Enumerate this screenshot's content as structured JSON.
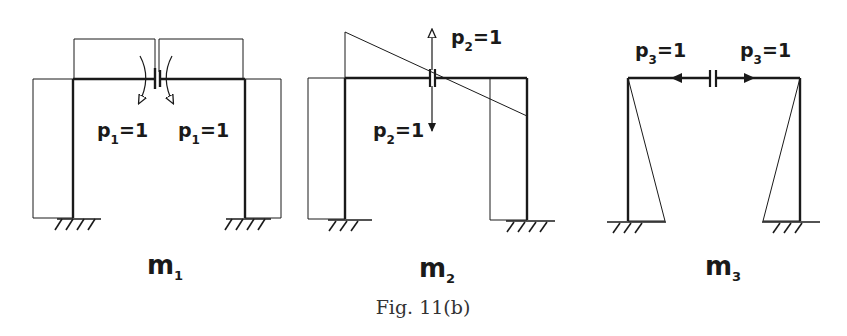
{
  "figure": {
    "caption_prefix": "Fig.",
    "caption_number": "11(b)",
    "caption": "Fig. 11(b)"
  },
  "panels": [
    {
      "id": "m1",
      "label": "m",
      "label_sub": "1",
      "loads": [
        {
          "text": "p",
          "sub": "1",
          "value": "=1",
          "side": "left"
        },
        {
          "text": "p",
          "sub": "1",
          "value": "=1",
          "side": "right"
        }
      ],
      "load_type": "unit moment pair at hinge"
    },
    {
      "id": "m2",
      "label": "m",
      "label_sub": "2",
      "loads": [
        {
          "text": "p",
          "sub": "2",
          "value": "=1",
          "direction": "up"
        },
        {
          "text": "p",
          "sub": "2",
          "value": "=1",
          "direction": "down"
        }
      ],
      "load_type": "unit shear pair at hinge"
    },
    {
      "id": "m3",
      "label": "m",
      "label_sub": "3",
      "loads": [
        {
          "text": "p",
          "sub": "3",
          "value": "=1",
          "direction": "left"
        },
        {
          "text": "p",
          "sub": "3",
          "value": "=1",
          "direction": "right"
        }
      ],
      "load_type": "unit axial pair at hinge"
    }
  ],
  "colors": {
    "ink": "#1a1a1a",
    "background": "#ffffff"
  }
}
